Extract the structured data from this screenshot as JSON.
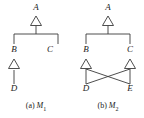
{
  "figure": {
    "background_color": "#ffffff",
    "line_color": "#3a3a3a",
    "text_color": "#1a1a1a",
    "arrowhead_style": "hollow-triangle",
    "arrowhead_fill": "#ffffff"
  },
  "panels": [
    {
      "id": "m1",
      "caption_prefix": "(a)",
      "caption_model": "M",
      "caption_subscript": "1",
      "nodes": [
        {
          "id": "A",
          "label": "A",
          "x": 36,
          "y": 9
        },
        {
          "id": "B",
          "label": "B",
          "x": 14,
          "y": 52
        },
        {
          "id": "C",
          "label": "C",
          "x": 50,
          "y": 52
        },
        {
          "id": "D",
          "label": "D",
          "x": 14,
          "y": 90
        }
      ],
      "edges": [
        {
          "from": "B",
          "to": "A",
          "kind": "generalization",
          "shared_arrowhead": true
        },
        {
          "from": "C",
          "to": "A",
          "kind": "generalization",
          "shared_arrowhead": true
        },
        {
          "from": "D",
          "to": "B",
          "kind": "generalization",
          "shared_arrowhead": false
        }
      ]
    },
    {
      "id": "m2",
      "caption_prefix": "(b)",
      "caption_model": "M",
      "caption_subscript": "2",
      "nodes": [
        {
          "id": "A",
          "label": "A",
          "x": 36,
          "y": 9
        },
        {
          "id": "B",
          "label": "B",
          "x": 14,
          "y": 52
        },
        {
          "id": "C",
          "label": "C",
          "x": 50,
          "y": 52
        },
        {
          "id": "D",
          "label": "D",
          "x": 14,
          "y": 90
        },
        {
          "id": "E",
          "label": "E",
          "x": 50,
          "y": 90
        }
      ],
      "edges": [
        {
          "from": "B",
          "to": "A",
          "kind": "generalization",
          "shared_arrowhead": true
        },
        {
          "from": "C",
          "to": "A",
          "kind": "generalization",
          "shared_arrowhead": true
        },
        {
          "from": "D",
          "to": "B",
          "kind": "generalization",
          "shared_arrowhead": false
        },
        {
          "from": "E",
          "to": "B",
          "kind": "generalization",
          "shared_arrowhead": false
        },
        {
          "from": "D",
          "to": "C",
          "kind": "generalization",
          "shared_arrowhead": false
        },
        {
          "from": "E",
          "to": "C",
          "kind": "generalization",
          "shared_arrowhead": false
        }
      ]
    }
  ]
}
